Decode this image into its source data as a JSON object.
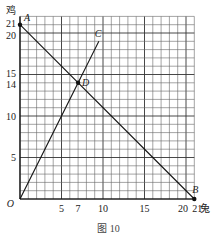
{
  "chart_data": {
    "type": "line",
    "title": "",
    "caption": "图 10",
    "xlabel": "兔",
    "ylabel": "鸡",
    "xlim": [
      0,
      21
    ],
    "ylim": [
      0,
      22
    ],
    "grid": true,
    "x_ticks": [
      "5",
      "7",
      "10",
      "15",
      "20",
      "21"
    ],
    "y_ticks": [
      "5",
      "10",
      "14",
      "15",
      "20",
      "21"
    ],
    "origin_label": "O",
    "points": [
      {
        "label": "A",
        "x": 0,
        "y": 21
      },
      {
        "label": "B",
        "x": 21,
        "y": 0
      },
      {
        "label": "C",
        "x": 9.5,
        "y": 19
      },
      {
        "label": "D",
        "x": 7,
        "y": 14
      }
    ],
    "series": [
      {
        "name": "AB",
        "x": [
          0,
          21
        ],
        "y": [
          21,
          0
        ]
      },
      {
        "name": "OC",
        "x": [
          0,
          9.5
        ],
        "y": [
          0,
          19
        ]
      }
    ]
  }
}
